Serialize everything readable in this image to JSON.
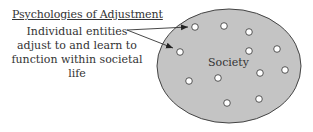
{
  "title": "Psychologies of Adjustment",
  "description_lines": [
    "Individual entities",
    "adjust to and learn to",
    "function within societal life"
  ],
  "society_label": "Society",
  "colors": {
    "society_fill": "#c4c4c4",
    "stroke": "#444444",
    "individual_fill": "#ffffff"
  },
  "individual_count": 12
}
